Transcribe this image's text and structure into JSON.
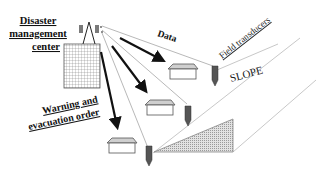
{
  "diagram": {
    "center_label": [
      "Disaster",
      "management",
      "center"
    ],
    "data_label": "Data",
    "field_label": "Field transducers",
    "slope_label": "SLOPE",
    "warning_label": [
      "Warning and",
      "evacuation order"
    ]
  },
  "colors": {
    "line": "#111111",
    "thin_line": "#9a9a9a",
    "sensor": "#555555",
    "slope_fill": "#cfcfcf"
  }
}
